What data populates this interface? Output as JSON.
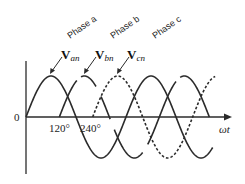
{
  "figure": {
    "phase_labels": [
      "Phase a",
      "Phase b",
      "Phase c"
    ],
    "voltage_labels": [
      {
        "main": "V",
        "sub": "an"
      },
      {
        "main": "V",
        "sub": "bn"
      },
      {
        "main": "V",
        "sub": "cn"
      }
    ],
    "origin_label": "0",
    "tick_labels": [
      "120°",
      "240°"
    ],
    "x_axis_label": "ωt",
    "colors": {
      "line": "#2b2b2b",
      "background": "#ffffff"
    }
  },
  "chart_data": {
    "type": "line",
    "title": "",
    "xlabel": "ωt",
    "ylabel": "",
    "x_ticks": [
      "0",
      "120°",
      "240°"
    ],
    "series": [
      {
        "name": "Van (Phase a)",
        "style": "solid",
        "phase_shift_deg": 0,
        "x_deg": [
          0,
          90,
          180,
          270,
          360,
          450,
          540,
          630
        ],
        "values": [
          0,
          1,
          0,
          -1,
          0,
          1,
          0,
          -1
        ]
      },
      {
        "name": "Vbn (Phase b)",
        "style": "solid-broken",
        "phase_shift_deg": 120,
        "x_deg": [
          120,
          210,
          300,
          390,
          480,
          570,
          660
        ],
        "values": [
          0,
          1,
          0,
          -1,
          0,
          1,
          0
        ]
      },
      {
        "name": "Vcn (Phase c)",
        "style": "dashed",
        "phase_shift_deg": 240,
        "x_deg": [
          240,
          330,
          420,
          510,
          600,
          690
        ],
        "values": [
          0,
          1,
          0,
          -1,
          0,
          1
        ]
      }
    ],
    "grid": false,
    "legend": "none"
  }
}
